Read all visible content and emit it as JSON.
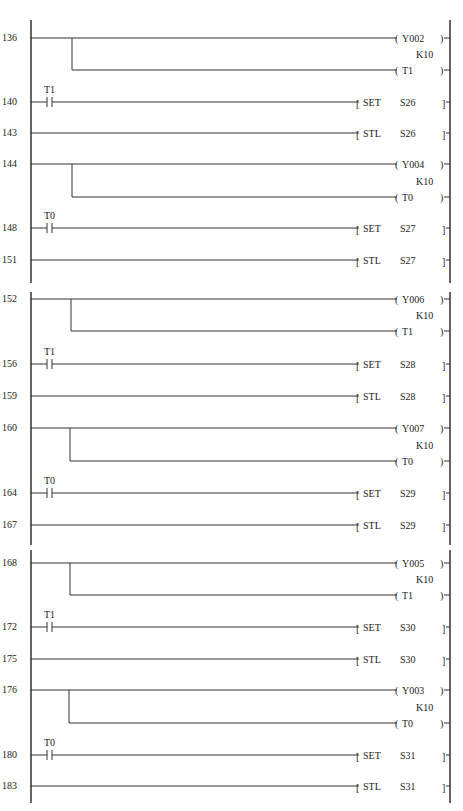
{
  "diagram": {
    "type": "PLC ladder diagram",
    "panels": [
      {
        "top": 20,
        "bottom": 283
      },
      {
        "top": 292,
        "bottom": 545
      },
      {
        "top": 550,
        "bottom": 803
      }
    ],
    "rungs": [
      {
        "step": "136",
        "y": 38,
        "kind": "coil-pair",
        "branch_x": 72,
        "y2": 70,
        "coils": [
          {
            "name": "Y002"
          },
          {
            "name": "T1",
            "preset": "K10"
          }
        ]
      },
      {
        "step": "140",
        "y": 102,
        "kind": "contact-set",
        "contact": "T1",
        "instr": "SET",
        "operand": "S26"
      },
      {
        "step": "143",
        "y": 133,
        "kind": "stl",
        "instr": "STL",
        "operand": "S26"
      },
      {
        "step": "144",
        "y": 164,
        "kind": "coil-pair",
        "branch_x": 72,
        "y2": 197,
        "coils": [
          {
            "name": "Y004"
          },
          {
            "name": "T0",
            "preset": "K10"
          }
        ]
      },
      {
        "step": "148",
        "y": 228,
        "kind": "contact-set",
        "contact": "T0",
        "instr": "SET",
        "operand": "S27"
      },
      {
        "step": "151",
        "y": 260,
        "kind": "stl",
        "instr": "STL",
        "operand": "S27"
      },
      {
        "step": "152",
        "y": 299,
        "kind": "coil-pair",
        "branch_x": 71,
        "y2": 331,
        "coils": [
          {
            "name": "Y006"
          },
          {
            "name": "T1",
            "preset": "K10"
          }
        ]
      },
      {
        "step": "156",
        "y": 364,
        "kind": "contact-set",
        "contact": "T1",
        "instr": "SET",
        "operand": "S28"
      },
      {
        "step": "159",
        "y": 396,
        "kind": "stl",
        "instr": "STL",
        "operand": "S28"
      },
      {
        "step": "160",
        "y": 428,
        "kind": "coil-pair",
        "branch_x": 70,
        "y2": 461,
        "coils": [
          {
            "name": "Y007"
          },
          {
            "name": "T0",
            "preset": "K10"
          }
        ]
      },
      {
        "step": "164",
        "y": 493,
        "kind": "contact-set",
        "contact": "T0",
        "instr": "SET",
        "operand": "S29"
      },
      {
        "step": "167",
        "y": 525,
        "kind": "stl",
        "instr": "STL",
        "operand": "S29"
      },
      {
        "step": "168",
        "y": 563,
        "kind": "coil-pair",
        "branch_x": 70,
        "y2": 595,
        "coils": [
          {
            "name": "Y005"
          },
          {
            "name": "T1",
            "preset": "K10"
          }
        ]
      },
      {
        "step": "172",
        "y": 627,
        "kind": "contact-set",
        "contact": "T1",
        "instr": "SET",
        "operand": "S30"
      },
      {
        "step": "175",
        "y": 659,
        "kind": "stl",
        "instr": "STL",
        "operand": "S30"
      },
      {
        "step": "176",
        "y": 690,
        "kind": "coil-pair",
        "branch_x": 69,
        "y2": 723,
        "coils": [
          {
            "name": "Y003"
          },
          {
            "name": "T0",
            "preset": "K10"
          }
        ]
      },
      {
        "step": "180",
        "y": 755,
        "kind": "contact-set",
        "contact": "T0",
        "instr": "SET",
        "operand": "S31"
      },
      {
        "step": "183",
        "y": 786,
        "kind": "stl",
        "instr": "STL",
        "operand": "S31"
      }
    ]
  }
}
